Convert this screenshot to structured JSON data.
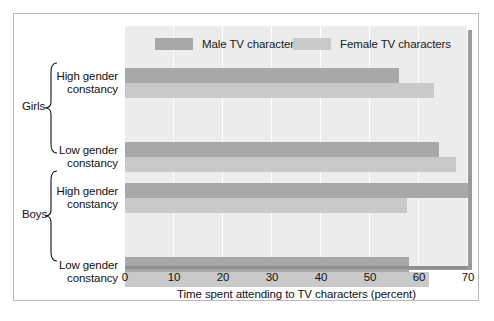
{
  "chart_data": {
    "type": "bar",
    "orientation": "horizontal",
    "title": "",
    "xlabel": "Time spent attending to TV characters (percent)",
    "ylabel": "",
    "xlim": [
      0,
      70
    ],
    "xticks": [
      0,
      10,
      20,
      30,
      40,
      50,
      60,
      70
    ],
    "xtick_labels": [
      "0",
      "10",
      "20",
      "30",
      "40",
      "50",
      "60",
      "70"
    ],
    "grid": "vertical",
    "legend_position": "top",
    "groups": [
      {
        "name": "Girls",
        "categories": [
          {
            "label_line1": "High gender",
            "label_line2": "constancy"
          },
          {
            "label_line1": "Low gender",
            "label_line2": "constancy"
          }
        ]
      },
      {
        "name": "Boys",
        "categories": [
          {
            "label_line1": "High gender",
            "label_line2": "constancy"
          },
          {
            "label_line1": "Low gender",
            "label_line2": "constancy"
          }
        ]
      }
    ],
    "categories": [
      "Girls - High gender constancy",
      "Girls - Low gender constancy",
      "Boys - High gender constancy",
      "Boys - Low gender constancy"
    ],
    "series": [
      {
        "name": "Male TV characters",
        "color": "#a8a8a8",
        "values": [
          56.0,
          64.0,
          70.0,
          58.0
        ]
      },
      {
        "name": "Female TV characters",
        "color": "#c9c9c9",
        "values": [
          63.0,
          67.5,
          57.5,
          62.0
        ]
      }
    ],
    "legend": [
      {
        "label": "Male TV characters",
        "color": "#a8a8a8"
      },
      {
        "label": "Female TV characters",
        "color": "#c9c9c9"
      }
    ]
  },
  "figure": {
    "frame_color": "#b9b9bd",
    "plot_background": "#ececed",
    "page_background": "#ffffff",
    "axis_color": "#8e8e93"
  }
}
